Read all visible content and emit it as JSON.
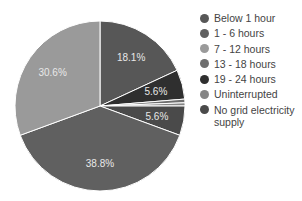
{
  "chart_data": {
    "type": "pie",
    "title": "",
    "categories": [
      "Below 1 hour",
      "1 - 6 hours",
      "7 - 12 hours",
      "13 - 18 hours",
      "19 - 24 hours",
      "Uninterrupted",
      "No grid electricity supply"
    ],
    "slices_clockwise_from_top": [
      {
        "name": "Below 1 hour",
        "value": 18.1,
        "label": "18.1%",
        "color": "#575757"
      },
      {
        "name": "19 - 24 hours",
        "value": 5.6,
        "label": "5.6%",
        "color": "#2f2f2f"
      },
      {
        "name": "13 - 18 hours",
        "value": 0.7,
        "label": "",
        "color": "#6e6e6e"
      },
      {
        "name": "Uninterrupted",
        "value": 0.6,
        "label": "",
        "color": "#858585"
      },
      {
        "name": "No grid electricity supply",
        "value": 5.6,
        "label": "5.6%",
        "color": "#4a4a4a"
      },
      {
        "name": "1 - 6 hours",
        "value": 38.8,
        "label": "38.8%",
        "color": "#606060"
      },
      {
        "name": "7 - 12 hours",
        "value": 30.6,
        "label": "30.6%",
        "color": "#9a9a9a"
      }
    ],
    "legend_position": "right"
  },
  "legend": [
    {
      "label": "Below 1 hour",
      "color": "#575757"
    },
    {
      "label": "1 - 6 hours",
      "color": "#606060"
    },
    {
      "label": "7 - 12 hours",
      "color": "#9a9a9a"
    },
    {
      "label": "13 - 18 hours",
      "color": "#6e6e6e"
    },
    {
      "label": "19 - 24 hours",
      "color": "#2f2f2f"
    },
    {
      "label": "Uninterrupted",
      "color": "#858585"
    },
    {
      "label": "No grid electricity",
      "label2": "supply",
      "color": "#4a4a4a"
    }
  ]
}
